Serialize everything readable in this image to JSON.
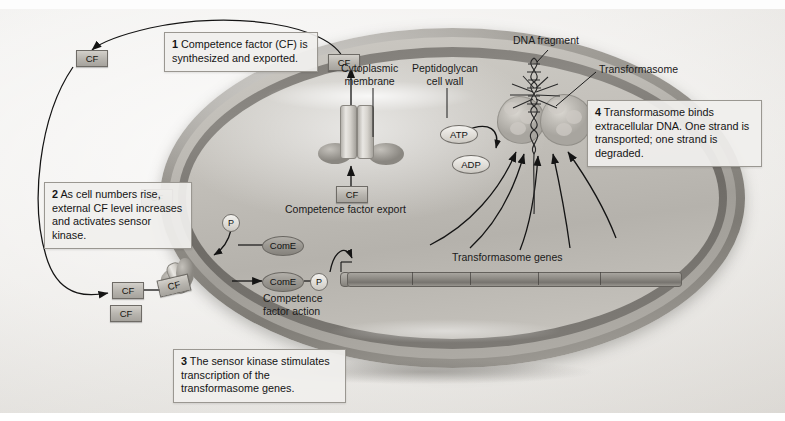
{
  "figure": {
    "title_cut_off": "",
    "type": "biological-process-diagram"
  },
  "steps": [
    {
      "num": "1",
      "text": "Competence factor (CF) is synthesized and exported."
    },
    {
      "num": "2",
      "text": "As cell numbers rise, external CF level increases and activates sensor kinase."
    },
    {
      "num": "3",
      "text": "The sensor kinase stimulates transcription of the transformasome genes."
    },
    {
      "num": "4",
      "text": "Transformasome binds extracellular DNA. One strand is transported; one strand is degraded."
    }
  ],
  "structure_labels": {
    "cytoplasmic_membrane": "Cytoplasmic\nmembrane",
    "peptidoglycan_cell_wall": "Peptidoglycan\ncell wall",
    "dna_fragment": "DNA fragment",
    "transformasome": "Transformasome",
    "transformasome_genes": "Transformasome genes",
    "competence_factor_export": "Competence factor export",
    "competence_factor_action": "Competence\nfactor action"
  },
  "molecules": {
    "cf": "CF",
    "atp": "ATP",
    "adp": "ADP",
    "phosphate": "P",
    "come": "ComE"
  },
  "cf_tokens": [
    {
      "id": "cf-exported-top",
      "label": "CF"
    },
    {
      "id": "cf-far-left",
      "label": "CF"
    },
    {
      "id": "cf-in-box2",
      "label": "CF"
    },
    {
      "id": "cf-cytoplasm-export",
      "label": "CF"
    },
    {
      "id": "cf-approaching",
      "label": "CF"
    },
    {
      "id": "cf-spare-lower",
      "label": "CF"
    },
    {
      "id": "cf-bound-receptor",
      "label": "CF"
    }
  ],
  "come_nodes": [
    {
      "id": "come-inactive",
      "label": "ComE"
    },
    {
      "id": "come-active",
      "label": "ComE"
    }
  ],
  "colors": {
    "page_background": "#ffffff",
    "plate_background": "#ece9e5",
    "cell_wall": "#bdbab4",
    "cytoplasmic_membrane": "#7e7b76",
    "cytoplasm": "#c4c1bb",
    "callout_background": "#f0efed",
    "callout_border": "#9a9791",
    "cf_token": "#b8b5af",
    "ink": "#1a1a1a"
  }
}
